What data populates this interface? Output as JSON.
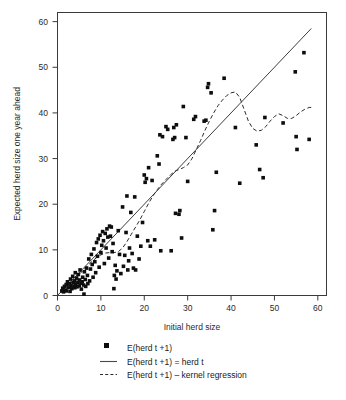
{
  "chart_data": {
    "type": "scatter",
    "title": "",
    "xlabel": "Initial herd size",
    "ylabel": "Expected herd size one year ahead",
    "xlim": [
      0,
      62
    ],
    "ylim": [
      0,
      62
    ],
    "xticks": [
      0,
      10,
      20,
      30,
      40,
      50,
      60
    ],
    "yticks": [
      0,
      10,
      20,
      30,
      40,
      50,
      60
    ],
    "xtick_labels": [
      "0",
      "10",
      "20",
      "30",
      "40",
      "50",
      "60"
    ],
    "ytick_labels": [
      "0",
      "10",
      "20",
      "30",
      "40",
      "50",
      "60"
    ],
    "grid": false,
    "legend_position": "below",
    "series": [
      {
        "name": "E(herd t +1)",
        "type": "scatter",
        "marker": "square",
        "color": "#0d0d0d",
        "points": [
          [
            1.0,
            1.0
          ],
          [
            1.2,
            1.6
          ],
          [
            1.4,
            0.8
          ],
          [
            1.6,
            2.0
          ],
          [
            1.8,
            1.2
          ],
          [
            2.0,
            2.4
          ],
          [
            2.1,
            1.0
          ],
          [
            2.3,
            3.0
          ],
          [
            2.5,
            1.8
          ],
          [
            2.7,
            2.6
          ],
          [
            2.9,
            0.9
          ],
          [
            3.0,
            3.6
          ],
          [
            3.1,
            2.2
          ],
          [
            3.3,
            1.5
          ],
          [
            3.5,
            4.2
          ],
          [
            3.6,
            2.8
          ],
          [
            3.8,
            2.0
          ],
          [
            3.9,
            3.2
          ],
          [
            4.0,
            1.7
          ],
          [
            4.1,
            5.0
          ],
          [
            4.2,
            2.5
          ],
          [
            4.4,
            3.8
          ],
          [
            4.5,
            1.9
          ],
          [
            4.7,
            2.9
          ],
          [
            4.8,
            4.6
          ],
          [
            5.0,
            2.1
          ],
          [
            5.1,
            3.4
          ],
          [
            5.2,
            5.6
          ],
          [
            5.4,
            2.7
          ],
          [
            5.5,
            1.4
          ],
          [
            5.7,
            3.0
          ],
          [
            5.8,
            4.0
          ],
          [
            6.0,
            2.3
          ],
          [
            6.1,
            0.3
          ],
          [
            6.2,
            5.2
          ],
          [
            6.4,
            3.5
          ],
          [
            6.5,
            2.0
          ],
          [
            6.7,
            6.0
          ],
          [
            6.9,
            4.4
          ],
          [
            7.0,
            2.6
          ],
          [
            7.2,
            8.0
          ],
          [
            7.4,
            3.2
          ],
          [
            7.6,
            5.8
          ],
          [
            7.8,
            9.0
          ],
          [
            8.0,
            6.8
          ],
          [
            8.2,
            4.0
          ],
          [
            8.4,
            10.2
          ],
          [
            8.6,
            7.4
          ],
          [
            8.8,
            5.0
          ],
          [
            9.0,
            11.6
          ],
          [
            9.2,
            8.6
          ],
          [
            9.4,
            12.4
          ],
          [
            9.6,
            6.2
          ],
          [
            9.8,
            13.2
          ],
          [
            10.0,
            9.4
          ],
          [
            10.2,
            11.0
          ],
          [
            10.4,
            14.0
          ],
          [
            10.6,
            12.0
          ],
          [
            10.8,
            7.0
          ],
          [
            11.0,
            13.6
          ],
          [
            11.2,
            10.4
          ],
          [
            11.4,
            14.6
          ],
          [
            11.6,
            12.8
          ],
          [
            11.8,
            8.2
          ],
          [
            12.0,
            15.2
          ],
          [
            12.2,
            13.0
          ],
          [
            12.4,
            15.0
          ],
          [
            12.6,
            9.6
          ],
          [
            12.8,
            11.4
          ],
          [
            13.0,
            1.5
          ],
          [
            13.1,
            4.4
          ],
          [
            13.3,
            6.6
          ],
          [
            13.5,
            3.6
          ],
          [
            13.7,
            5.4
          ],
          [
            14.0,
            14.2
          ],
          [
            14.3,
            9.0
          ],
          [
            14.6,
            4.8
          ],
          [
            15.0,
            19.4
          ],
          [
            15.2,
            6.4
          ],
          [
            15.5,
            8.8
          ],
          [
            15.8,
            13.8
          ],
          [
            16.0,
            21.8
          ],
          [
            16.2,
            5.6
          ],
          [
            16.4,
            7.6
          ],
          [
            16.6,
            10.4
          ],
          [
            16.9,
            18.2
          ],
          [
            17.2,
            9.2
          ],
          [
            17.5,
            6.0
          ],
          [
            17.8,
            21.6
          ],
          [
            18.0,
            5.6
          ],
          [
            18.4,
            13.0
          ],
          [
            18.8,
            8.0
          ],
          [
            19.2,
            10.8
          ],
          [
            19.6,
            16.0
          ],
          [
            20.0,
            26.4
          ],
          [
            20.2,
            24.8
          ],
          [
            20.5,
            25.6
          ],
          [
            20.8,
            12.0
          ],
          [
            21.0,
            28.0
          ],
          [
            21.4,
            10.8
          ],
          [
            21.8,
            25.2
          ],
          [
            22.4,
            12.2
          ],
          [
            23.0,
            30.6
          ],
          [
            23.4,
            28.8
          ],
          [
            23.6,
            35.2
          ],
          [
            23.8,
            9.8
          ],
          [
            24.2,
            34.8
          ],
          [
            25.0,
            37.0
          ],
          [
            25.4,
            36.4
          ],
          [
            26.2,
            9.8
          ],
          [
            26.6,
            34.2
          ],
          [
            26.8,
            36.8
          ],
          [
            27.0,
            34.6
          ],
          [
            27.2,
            18.0
          ],
          [
            27.4,
            37.4
          ],
          [
            28.0,
            17.8
          ],
          [
            28.2,
            18.6
          ],
          [
            28.6,
            12.6
          ],
          [
            29.0,
            41.4
          ],
          [
            29.6,
            34.6
          ],
          [
            30.0,
            25.0
          ],
          [
            31.4,
            38.6
          ],
          [
            31.8,
            39.2
          ],
          [
            33.8,
            38.2
          ],
          [
            34.2,
            38.4
          ],
          [
            34.6,
            45.6
          ],
          [
            34.8,
            46.4
          ],
          [
            35.4,
            44.4
          ],
          [
            35.8,
            14.4
          ],
          [
            36.2,
            18.6
          ],
          [
            36.6,
            27.0
          ],
          [
            38.4,
            47.6
          ],
          [
            41.0,
            36.8
          ],
          [
            42.0,
            24.6
          ],
          [
            45.8,
            33.0
          ],
          [
            46.6,
            27.6
          ],
          [
            47.4,
            25.8
          ],
          [
            47.8,
            39.0
          ],
          [
            52.0,
            37.8
          ],
          [
            54.8,
            49.0
          ],
          [
            55.0,
            34.8
          ],
          [
            55.2,
            32.0
          ],
          [
            56.8,
            53.2
          ],
          [
            58.0,
            34.2
          ]
        ]
      }
    ],
    "reference_lines": [
      {
        "name": "E(herd t +1) = herd t",
        "type": "line",
        "style": "solid",
        "color": "#3d3d3d",
        "points": [
          [
            0.0,
            0.0
          ],
          [
            58.5,
            58.5
          ]
        ]
      },
      {
        "name": "E(herd t +1) - kernel regression",
        "type": "line",
        "style": "dashed",
        "color": "#2b2b2b",
        "points": [
          [
            1.0,
            0.6
          ],
          [
            2.0,
            1.6
          ],
          [
            3.0,
            2.6
          ],
          [
            4.0,
            3.6
          ],
          [
            5.0,
            4.6
          ],
          [
            6.0,
            5.6
          ],
          [
            7.0,
            6.6
          ],
          [
            8.0,
            7.5
          ],
          [
            9.0,
            8.3
          ],
          [
            10.0,
            8.9
          ],
          [
            11.0,
            9.3
          ],
          [
            12.0,
            9.4
          ],
          [
            13.0,
            9.4
          ],
          [
            14.0,
            9.6
          ],
          [
            15.0,
            10.4
          ],
          [
            16.0,
            11.8
          ],
          [
            17.0,
            13.4
          ],
          [
            18.0,
            15.0
          ],
          [
            19.0,
            16.6
          ],
          [
            20.0,
            18.4
          ],
          [
            21.0,
            20.2
          ],
          [
            22.0,
            21.8
          ],
          [
            23.0,
            23.2
          ],
          [
            24.0,
            24.4
          ],
          [
            25.0,
            25.4
          ],
          [
            26.0,
            26.4
          ],
          [
            27.0,
            27.2
          ],
          [
            28.0,
            27.6
          ],
          [
            29.0,
            28.0
          ],
          [
            30.0,
            28.6
          ],
          [
            31.0,
            30.0
          ],
          [
            32.0,
            32.0
          ],
          [
            33.0,
            34.0
          ],
          [
            34.0,
            36.2
          ],
          [
            35.0,
            38.2
          ],
          [
            36.0,
            40.0
          ],
          [
            37.0,
            41.6
          ],
          [
            38.0,
            42.8
          ],
          [
            39.0,
            43.8
          ],
          [
            40.0,
            44.4
          ],
          [
            41.0,
            44.6
          ],
          [
            42.0,
            43.4
          ],
          [
            43.0,
            40.8
          ],
          [
            44.0,
            38.2
          ],
          [
            45.0,
            36.6
          ],
          [
            46.0,
            36.0
          ],
          [
            47.0,
            36.2
          ],
          [
            48.0,
            37.0
          ],
          [
            49.0,
            38.2
          ],
          [
            50.0,
            39.2
          ],
          [
            51.0,
            39.8
          ],
          [
            52.0,
            39.4
          ],
          [
            53.0,
            38.8
          ],
          [
            54.0,
            38.8
          ],
          [
            55.0,
            39.4
          ],
          [
            56.0,
            40.2
          ],
          [
            57.0,
            40.8
          ],
          [
            58.0,
            41.2
          ],
          [
            58.8,
            41.2
          ]
        ]
      }
    ]
  },
  "legend": {
    "items": [
      {
        "label": "E(herd t +1)",
        "marker": "square-marker"
      },
      {
        "label": "E(herd t +1) = herd t",
        "marker": "solid-line"
      },
      {
        "label": "E(herd t +1) – kernel regression",
        "marker": "dashed-line"
      }
    ]
  },
  "colors": {
    "marker": "#0d0d0d",
    "identity_line": "#3d3d3d",
    "kernel_line": "#2b2b2b",
    "frame": "#3a3a3a",
    "background": "#ffffff"
  }
}
